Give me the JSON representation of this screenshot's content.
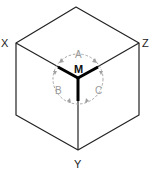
{
  "diagram": {
    "type": "isometric-cube",
    "axis_labels": {
      "x": "X",
      "y": "Y",
      "z": "Z"
    },
    "center_label": "M",
    "rotation_labels": {
      "a": "A",
      "b": "B",
      "c": "C"
    },
    "colors": {
      "edge": "#222222",
      "axis": "#000000",
      "rotation_circle": "#a8a8a8",
      "rotation_text": "#9a9a9a"
    }
  }
}
